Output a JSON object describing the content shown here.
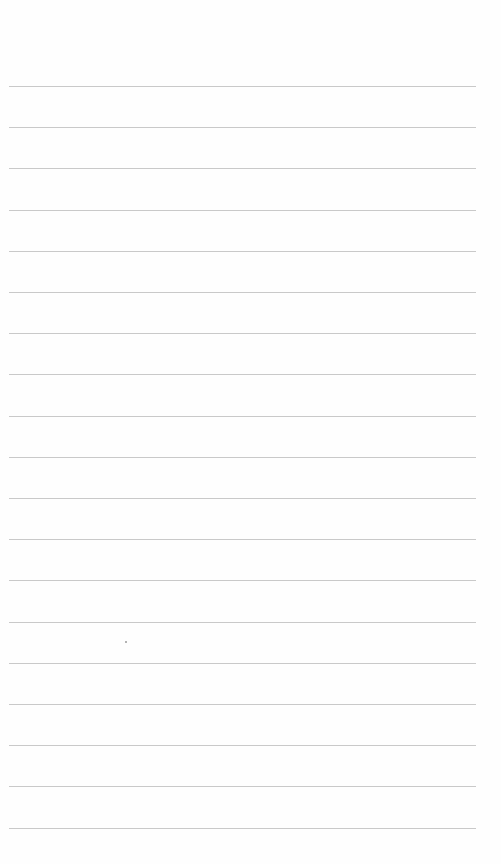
{
  "page": {
    "type": "lined-paper",
    "background": "#fefefe",
    "rule_color": "#c9c9c9",
    "rule_count": 19,
    "first_rule_y": 86,
    "rule_spacing": 41.2,
    "rule_left": 9,
    "rule_width": 467
  }
}
